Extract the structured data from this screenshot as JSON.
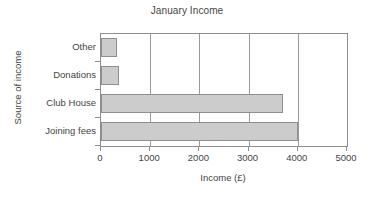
{
  "chart_data": {
    "type": "bar",
    "orientation": "horizontal",
    "title": "January Income",
    "xlabel": "Income (£)",
    "ylabel": "Source of income",
    "categories": [
      "Joining fees",
      "Club House",
      "Donations",
      "Other"
    ],
    "values": [
      4000,
      3700,
      370,
      330
    ],
    "xlim": [
      0,
      5000
    ],
    "xticks": [
      0,
      1000,
      2000,
      3000,
      4000,
      5000
    ],
    "xtick_labels": [
      "0",
      "1000",
      "2000",
      "3000",
      "4000",
      "5000"
    ],
    "grid": true,
    "grid_axis": "x",
    "legend": false,
    "bar_fill_color": "#cccccc",
    "bar_border_color": "#8f8f8f",
    "axis_color": "#8e8e8e",
    "text_color": "#454545",
    "background_color": "#ffffff",
    "display_order_top_to_bottom": [
      "Other",
      "Donations",
      "Club House",
      "Joining fees"
    ]
  }
}
